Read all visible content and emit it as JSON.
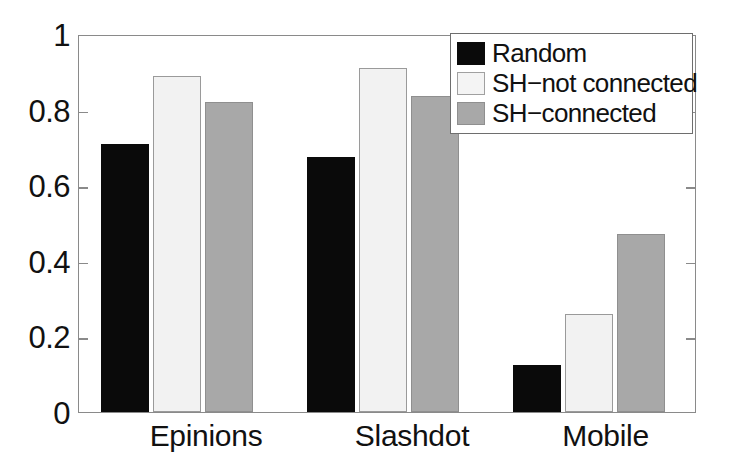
{
  "chart_data": {
    "type": "bar",
    "title": "",
    "xlabel": "",
    "ylabel": "",
    "categories": [
      "Epinions",
      "Slashdot",
      "Mobile"
    ],
    "series": [
      {
        "name": "Random",
        "color": "#0a0a0a",
        "values": [
          0.71,
          0.675,
          0.125
        ]
      },
      {
        "name": "SH−not connected",
        "color": "#f2f2f2",
        "values": [
          0.89,
          0.91,
          0.26
        ]
      },
      {
        "name": "SH−connected",
        "color": "#a8a8a8",
        "values": [
          0.82,
          0.835,
          0.47
        ]
      }
    ],
    "ylim": [
      0,
      1
    ],
    "yticks": [
      0,
      0.2,
      0.4,
      0.6,
      0.8,
      1
    ],
    "ytick_labels": [
      "0",
      "0.2",
      "0.4",
      "0.6",
      "0.8",
      "1"
    ],
    "grid": false,
    "legend_position": "top-right"
  },
  "legend": {
    "entries": [
      {
        "label": "Random"
      },
      {
        "label": "SH−not connected"
      },
      {
        "label": "SH−connected"
      }
    ]
  }
}
